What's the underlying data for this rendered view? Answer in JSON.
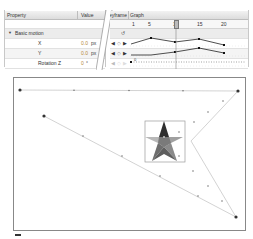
{
  "motion_editor": {
    "columns": {
      "property": "Property",
      "value": "Value",
      "keyframe": "Keyframe",
      "graph": "Graph"
    },
    "ruler": {
      "ticks": [
        "1",
        "5",
        "10",
        "15",
        "20"
      ],
      "playhead_frame": 10
    },
    "section": {
      "label": "Basic motion",
      "expanded": true
    },
    "properties": [
      {
        "name": "X",
        "value": "0.0",
        "unit": "px"
      },
      {
        "name": "Y",
        "value": "0.0",
        "unit": "px"
      },
      {
        "name": "Rotation Z",
        "value": "0",
        "unit": "°"
      }
    ],
    "reset_icon": "reset-icon",
    "keyframe_nav": [
      "prev-keyframe-icon",
      "add-keyframe-icon",
      "next-keyframe-icon"
    ]
  },
  "stage": {
    "path_color": "#c8c8c8",
    "star_colors": {
      "dark": "#3a3a3a",
      "mid": "#7a7a7a",
      "light": "#b0b0b0"
    },
    "selection_box_color": "#9a9a9a"
  }
}
